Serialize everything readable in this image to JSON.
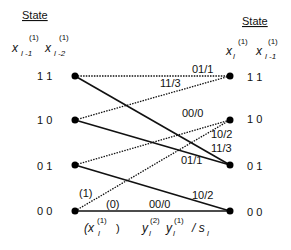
{
  "left": {
    "header": "State",
    "var1": {
      "base": "x",
      "sup": "(1)",
      "sub": "l -1"
    },
    "var2": {
      "base": "x",
      "sup": "(1)",
      "sub": "l -2"
    },
    "states": [
      "1 1",
      "1 0",
      "0 1",
      "0 0"
    ]
  },
  "right": {
    "header": "State",
    "var1": {
      "base": "x",
      "sup": "(1)",
      "sub": "l"
    },
    "var2": {
      "base": "x",
      "sup": "(1)",
      "sub": "l -1"
    },
    "states": [
      "1 1",
      "1 0",
      "0 1",
      "0 0"
    ]
  },
  "edges": {
    "e11_11": "01/1",
    "e10_11": "11/3",
    "e01_10": "00/0",
    "e00_10": "10/2",
    "e11_01": "11/3",
    "e10_01": "01/1",
    "e01_00": "10/2",
    "e00_00": "00/0"
  },
  "input_labels": {
    "one": "(1)",
    "zero": "(0)"
  },
  "legend": {
    "input": {
      "open": "(x",
      "sup": "(1)",
      "sub": "l",
      "close": ")"
    },
    "out2": {
      "base": "y",
      "sup": "(2)",
      "sub": "l"
    },
    "out1": {
      "base": "y",
      "sup": "(1)",
      "sub": "l"
    },
    "sep": "/ s",
    "sep_sub": "l"
  },
  "colors": {
    "line": "#111111",
    "node": "#000000"
  }
}
